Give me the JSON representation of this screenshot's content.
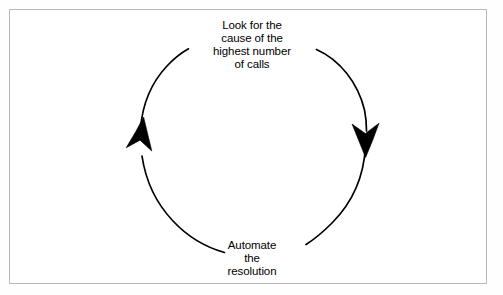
{
  "figure": {
    "kind": "cycle-diagram",
    "border_color": "#b9b9b9",
    "background_color": "#ffffff",
    "stroke_color": "#000000"
  },
  "diagram": {
    "steps": [
      {
        "id": "step-top",
        "position": "top",
        "lines": [
          "Look for the",
          "cause of the",
          "highest number",
          "of calls"
        ]
      },
      {
        "id": "step-bottom",
        "position": "bottom",
        "lines": [
          "Automate",
          "the",
          "resolution"
        ]
      }
    ],
    "arrows": [
      {
        "id": "arrow-right-down",
        "direction": "down",
        "side": "right",
        "style": "barbed"
      },
      {
        "id": "arrow-left-up",
        "direction": "up",
        "side": "left",
        "style": "barbed"
      }
    ]
  }
}
